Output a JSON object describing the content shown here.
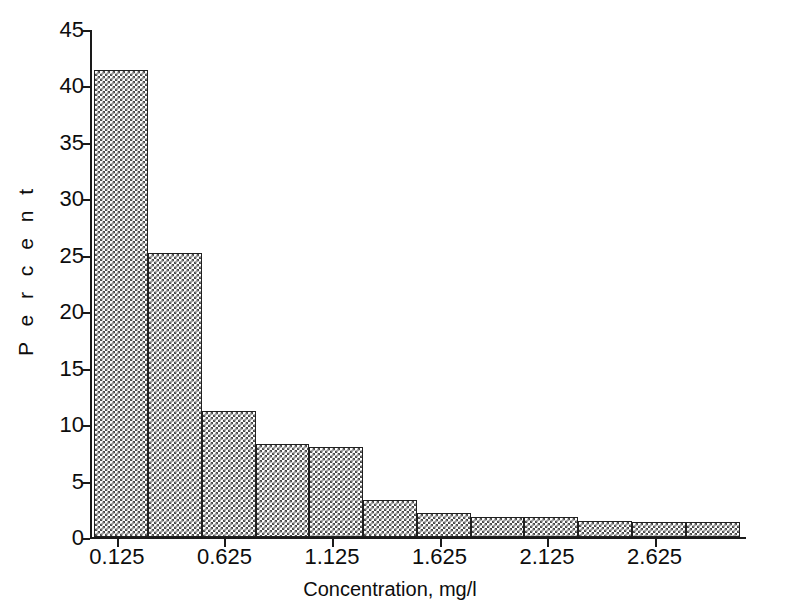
{
  "chart_data": {
    "type": "bar",
    "title": "",
    "subtitle": "",
    "xlabel": "Concentration, mg/l",
    "ylabel": "P e r c e n t",
    "ylabel_plain": "Percent",
    "grid": false,
    "legend": null,
    "legend_position": "none",
    "xlim": [
      0.0,
      3.05
    ],
    "ylim": [
      0,
      45
    ],
    "ytick_labels": [
      "45",
      "40",
      "35",
      "30",
      "25",
      "20",
      "15",
      "10",
      "5",
      "0"
    ],
    "ytick_values": [
      45,
      40,
      35,
      30,
      25,
      20,
      15,
      10,
      5,
      0
    ],
    "xtick_labels": [
      "0.125",
      "0.625",
      "1.125",
      "1.625",
      "2.125",
      "2.625"
    ],
    "xtick_values": [
      0.125,
      0.625,
      1.125,
      1.625,
      2.125,
      2.625
    ],
    "bin_width": 0.25,
    "bin_starts": [
      0.02,
      0.27,
      0.52,
      0.77,
      1.02,
      1.27,
      1.52,
      1.77,
      2.02,
      2.27,
      2.52,
      2.77
    ],
    "categories": [
      "0.125",
      "0.375",
      "0.625",
      "0.875",
      "1.125",
      "1.375",
      "1.625",
      "1.875",
      "2.125",
      "2.375",
      "2.625",
      "2.875"
    ],
    "values": [
      41.4,
      25.2,
      11.2,
      8.2,
      8.0,
      3.3,
      2.1,
      1.8,
      1.8,
      1.4,
      1.3,
      1.3
    ],
    "bar_fill": "crosshatch",
    "bar_edge_color": "#202020",
    "bar_pattern_color": "#4a4a4a",
    "background_color": "#ffffff",
    "axis_color": "#1a1a1a"
  }
}
